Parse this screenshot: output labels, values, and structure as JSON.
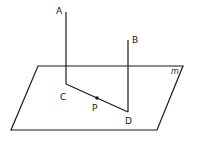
{
  "diagram": {
    "plane_label": "m",
    "points": {
      "A": "A",
      "B": "B",
      "C": "C",
      "D": "D",
      "P": "P"
    },
    "colors": {
      "stroke": "#1a1a1a",
      "background": "#ffffff"
    }
  }
}
